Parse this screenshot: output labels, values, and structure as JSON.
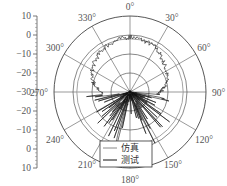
{
  "chart_data": {
    "type": "polar-line",
    "title": "",
    "radial_axis": {
      "ticks": [
        10,
        0,
        -10,
        -20,
        -30,
        -20,
        -10,
        0,
        10
      ],
      "range": [
        -30,
        10
      ],
      "unit": "dB"
    },
    "angular_axis": {
      "ticks": [
        "0°",
        "30°",
        "60°",
        "90°",
        "120°",
        "150°",
        "180°",
        "210°",
        "240°",
        "270°",
        "300°",
        "330°"
      ],
      "direction": "clockwise",
      "zero_position": "top"
    },
    "rings": [
      -20,
      -10,
      0,
      10
    ],
    "legend": [
      {
        "label": "仿真",
        "color": "#888888"
      },
      {
        "label": "测试",
        "color": "#111111"
      }
    ],
    "series": [
      {
        "name": "仿真",
        "description": "smooth nearly circular pattern",
        "angles": [
          0,
          30,
          60,
          90,
          120,
          150,
          180,
          210,
          240,
          270,
          300,
          330
        ],
        "values": [
          -2,
          -2,
          -2,
          -2,
          -2,
          -2,
          -2,
          -2,
          -2,
          -2,
          -2,
          -2
        ]
      },
      {
        "name": "测试",
        "description": "noisy measured pattern; stable in upper half, strongly fluctuating in lower half",
        "angles": [
          0,
          15,
          30,
          45,
          60,
          75,
          90,
          105,
          120,
          135,
          150,
          165,
          180,
          195,
          210,
          225,
          240,
          255,
          270,
          285,
          300,
          315,
          330,
          345
        ],
        "values": [
          -1,
          -2,
          -3,
          -6,
          -8,
          -10,
          -14,
          -18,
          -12,
          -16,
          -10,
          -14,
          -22,
          -10,
          -16,
          -12,
          -18,
          -14,
          -15,
          -10,
          -7,
          -5,
          -3,
          -2
        ]
      }
    ]
  },
  "axis": {
    "left_ticks": [
      "10",
      "0",
      "−10",
      "−20",
      "−30",
      "−20",
      "−10",
      "0",
      "10"
    ],
    "angle_labels": [
      "0°",
      "30°",
      "60°",
      "90°",
      "120°",
      "150°",
      "180°",
      "210°",
      "240°",
      "270°",
      "300°",
      "330°"
    ]
  },
  "legend": {
    "items": [
      {
        "label": "仿真"
      },
      {
        "label": "测试"
      }
    ]
  }
}
